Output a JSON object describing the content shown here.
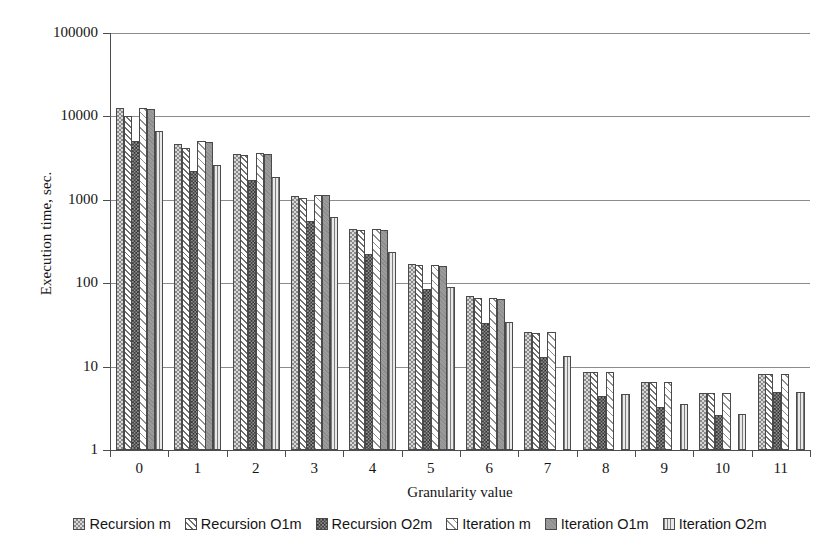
{
  "chart_data": {
    "type": "bar",
    "title": "",
    "xlabel": "Granularity value",
    "ylabel": "Execution time, sec.",
    "yscale": "log",
    "ylim": [
      1,
      100000
    ],
    "y_ticks": [
      100000,
      10000,
      1000,
      100,
      10,
      1
    ],
    "y_tick_labels": [
      "100000",
      "10000",
      "1000",
      "100",
      "10",
      "1"
    ],
    "grid": true,
    "legend_position": "bottom",
    "categories": [
      "0",
      "1",
      "2",
      "3",
      "4",
      "5",
      "6",
      "7",
      "8",
      "9",
      "10",
      "11"
    ],
    "series": [
      {
        "name": "Recursion m",
        "pattern": "light-checker",
        "values": [
          12500,
          4700,
          3500,
          1100,
          450,
          170,
          70,
          26,
          8.6,
          6.6,
          4.8,
          8.2
        ]
      },
      {
        "name": "Recursion O1m",
        "pattern": "diagonal-hatch",
        "values": [
          10000,
          4200,
          3400,
          1050,
          430,
          165,
          66,
          25,
          8.6,
          6.6,
          4.8,
          8.2
        ]
      },
      {
        "name": "Recursion O2m",
        "pattern": "dark-checker",
        "values": [
          5100,
          2200,
          1750,
          560,
          225,
          85,
          33,
          13,
          4.5,
          3.3,
          2.6,
          4.9
        ]
      },
      {
        "name": "Iteration m",
        "pattern": "light-diagonal",
        "values": [
          12600,
          5100,
          3600,
          1150,
          450,
          165,
          66,
          26,
          8.6,
          6.6,
          4.8,
          8.2
        ]
      },
      {
        "name": "Iteration O1m",
        "pattern": "solid-gray",
        "values": [
          12300,
          5000,
          3550,
          1130,
          440,
          162,
          64,
          0,
          0,
          0,
          0,
          0
        ]
      },
      {
        "name": "Iteration O2m",
        "pattern": "vertical-lines",
        "values": [
          6700,
          2600,
          1900,
          620,
          240,
          90,
          34,
          13.5,
          4.7,
          3.6,
          2.7,
          4.9
        ]
      }
    ]
  },
  "legend": {
    "items": [
      {
        "label": "Recursion m"
      },
      {
        "label": "Recursion O1m"
      },
      {
        "label": "Recursion O2m"
      },
      {
        "label": "Iteration m"
      },
      {
        "label": "Iteration O1m"
      },
      {
        "label": "Iteration O2m"
      }
    ]
  },
  "colors": {
    "axis": "#4d4d4d",
    "gridline": "#8c8c8c",
    "text": "#141414",
    "background": "#ffffff"
  }
}
